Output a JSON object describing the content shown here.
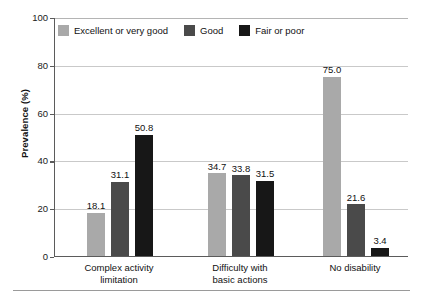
{
  "chart_data": {
    "type": "bar",
    "title": "",
    "xlabel": "",
    "ylabel": "Prevalence (%)",
    "ylim": [
      0,
      100
    ],
    "yticks": [
      0,
      20,
      40,
      60,
      80,
      100
    ],
    "ytick_labels": [
      "0",
      "20",
      "40",
      "60",
      "80",
      "100"
    ],
    "grid": "horizontal",
    "legend_position": "top-left-inside",
    "categories": [
      "Complex activity\nlimitation",
      "Difficulty with\nbasic actions",
      "No disability"
    ],
    "series": [
      {
        "name": "Excellent or very good",
        "color": "#a9a9a9",
        "values": [
          18.1,
          34.7,
          75.0
        ],
        "labels": [
          "18.1",
          "34.7",
          "75.0"
        ]
      },
      {
        "name": "Good",
        "color": "#4a4a4a",
        "values": [
          31.1,
          33.8,
          21.6
        ],
        "labels": [
          "31.1",
          "33.8",
          "21.6"
        ]
      },
      {
        "name": "Fair or poor",
        "color": "#171717",
        "values": [
          50.8,
          31.5,
          3.4
        ],
        "labels": [
          "50.8",
          "31.5",
          "3.4"
        ]
      }
    ]
  }
}
